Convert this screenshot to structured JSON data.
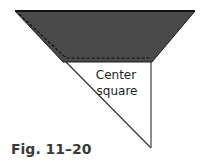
{
  "figure": {
    "colors": {
      "fill": "#4a4a4a",
      "outline": "#1a1a1a",
      "dash": "#111111",
      "line": "#555555",
      "background": "#ffffff"
    },
    "shaded_piece": {
      "points": "15,11 195,11 152,62 63,62"
    },
    "center_square_label": {
      "line1": "Center",
      "line2": "square"
    }
  },
  "caption": "Fig. 11–20"
}
